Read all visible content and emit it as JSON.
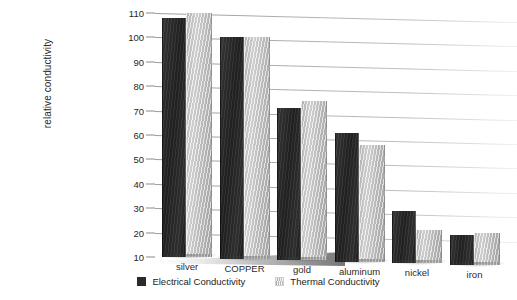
{
  "chart_data": {
    "type": "bar",
    "title": "",
    "xlabel": "",
    "ylabel": "relative conductivity",
    "ylim": [
      10,
      110
    ],
    "yticks": [
      10,
      20,
      30,
      40,
      50,
      60,
      70,
      80,
      90,
      100,
      110
    ],
    "grid": true,
    "legend_position": "bottom-center",
    "categories": [
      "silver",
      "COPPER",
      "gold",
      "aluminum",
      "nickel",
      "iron"
    ],
    "series": [
      {
        "name": "Electrical Conductivity",
        "color": "#2b2b2b",
        "values": [
          108,
          100,
          71,
          61,
          29,
          19
        ]
      },
      {
        "name": "Thermal Conductivity",
        "color": "#d0d0d0",
        "values": [
          110,
          100,
          74,
          56,
          21,
          20
        ]
      }
    ]
  },
  "axis": {
    "y_title": "relative conductivity",
    "tick_labels": [
      "110",
      "100",
      "90",
      "80",
      "70",
      "60",
      "50",
      "40",
      "30",
      "20",
      "10"
    ]
  },
  "categories": {
    "labels": [
      "silver",
      "COPPER",
      "gold",
      "aluminum",
      "nickel",
      "iron"
    ]
  },
  "legend": {
    "items": [
      {
        "label": "Electrical Conductivity",
        "swatch": "dark-square-swatch"
      },
      {
        "label": "Thermal Conductivity",
        "swatch": "light-square-swatch"
      }
    ]
  },
  "artifact": {
    "text": ""
  }
}
